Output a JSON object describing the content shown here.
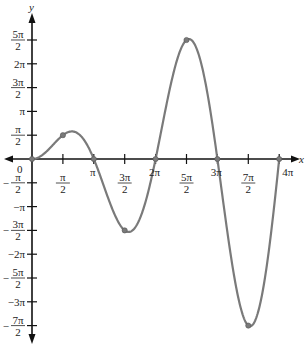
{
  "chart_data": {
    "type": "line",
    "title": "",
    "function": "y = x sin x",
    "xlabel": "x",
    "ylabel": "y",
    "xlim": [
      -0.3,
      13.2
    ],
    "ylim": [
      -11.6,
      8.5
    ],
    "grid": false,
    "x_tick_labels": [
      "π/2",
      "π",
      "3π/2",
      "2π",
      "5π/2",
      "3π",
      "7π/2",
      "4π"
    ],
    "x_tick_values": [
      1.5708,
      3.1416,
      4.7124,
      6.2832,
      7.854,
      9.4248,
      10.9956,
      12.5664
    ],
    "y_tick_labels": [
      "5π/2",
      "2π",
      "3π/2",
      "π",
      "π/2",
      "0",
      "-π/2",
      "-π",
      "-3π/2",
      "-2π",
      "-5π/2",
      "-3π",
      "-7π/2"
    ],
    "y_tick_values": [
      7.854,
      6.2832,
      4.7124,
      3.1416,
      1.5708,
      0,
      -1.5708,
      -3.1416,
      -4.7124,
      -6.2832,
      -7.854,
      -9.4248,
      -10.9956
    ],
    "marked_points": [
      {
        "x": 0,
        "y": 0,
        "label": "(0, 0)"
      },
      {
        "x": 1.5708,
        "y": 1.5708,
        "label": "(π/2, π/2)"
      },
      {
        "x": 3.1416,
        "y": 0,
        "label": "(π, 0)"
      },
      {
        "x": 4.7124,
        "y": -4.7124,
        "label": "(3π/2, -3π/2)"
      },
      {
        "x": 6.2832,
        "y": 0,
        "label": "(2π, 0)"
      },
      {
        "x": 7.854,
        "y": 7.854,
        "label": "(5π/2, 5π/2)"
      },
      {
        "x": 9.4248,
        "y": 0,
        "label": "(3π, 0)"
      },
      {
        "x": 10.9956,
        "y": -10.9956,
        "label": "(7π/2, -7π/2)"
      },
      {
        "x": 12.5664,
        "y": 0,
        "label": "(4π, 0)"
      }
    ],
    "series": [
      {
        "name": "x sin x",
        "color": "#7a7a7a",
        "x_range": [
          0,
          12.5664
        ]
      }
    ]
  },
  "labels": {
    "x_axis": "x",
    "y_axis": "y",
    "origin": "0"
  },
  "colors": {
    "axis": "#111111",
    "curve": "#7a7a7a",
    "point": "#7a7a7a"
  }
}
